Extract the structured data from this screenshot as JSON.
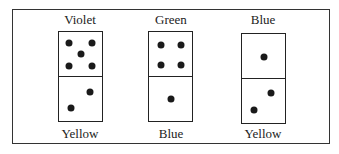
{
  "dominoes": [
    {
      "top_label": "Violet",
      "bottom_label": "Yellow",
      "top_pips": 5,
      "bottom_pips": 2
    },
    {
      "top_label": "Green",
      "bottom_label": "Blue",
      "top_pips": 4,
      "bottom_pips": 1
    },
    {
      "top_label": "Blue",
      "bottom_label": "Yellow",
      "top_pips": 1,
      "bottom_pips": 2
    }
  ]
}
